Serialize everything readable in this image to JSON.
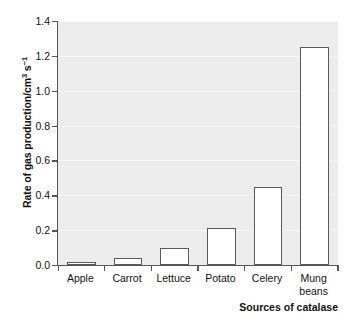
{
  "chart_data": {
    "type": "bar",
    "title": "",
    "subtitle": "",
    "xlabel": "Sources of catalase",
    "ylabel": "Rate of gas production/cm3 s-1",
    "ylabel_parts": {
      "main": "Rate of gas production/cm",
      "sup1": "3",
      "mid": " s",
      "sup2": "−1"
    },
    "categories": [
      "Apple",
      "Carrot",
      "Lettuce",
      "Potato",
      "Celery",
      "Mung beans"
    ],
    "category_lines": [
      [
        "Apple"
      ],
      [
        "Carrot"
      ],
      [
        "Lettuce"
      ],
      [
        "Potato"
      ],
      [
        "Celery"
      ],
      [
        "Mung",
        "beans"
      ]
    ],
    "values": [
      0.02,
      0.04,
      0.1,
      0.215,
      0.45,
      1.25
    ],
    "ylim": [
      0.0,
      1.4
    ],
    "ytick_values": [
      0.0,
      0.2,
      0.4,
      0.6,
      0.8,
      1.0,
      1.2,
      1.4
    ],
    "ytick_labels": [
      "0.0",
      "0.2",
      "0.4",
      "0.6",
      "0.8",
      "1.0",
      "1.2",
      "1.4"
    ],
    "grid": true,
    "grid_axis": "y",
    "legend": false,
    "legend_position": "none",
    "bar_fill_color": "#ffffff",
    "bar_edge_color": "#5a5a5a",
    "plot_background_color": "#ececec",
    "axis_color": "#555555",
    "gridline_color": "#f6f6f6",
    "text_color": "#111111",
    "bar_width_fraction": 0.62
  }
}
